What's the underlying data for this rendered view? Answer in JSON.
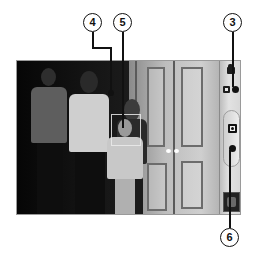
{
  "app": {
    "name": "Camera",
    "mode": "still-photo"
  },
  "viewfinder": {
    "scene": "group of four people standing in front of a white paneled door",
    "focus_indicator": "focus-box"
  },
  "controls": {
    "camcorder_switch": {
      "icon": "camcorder-icon"
    },
    "camera_switch": {
      "icon": "camera-icon"
    },
    "shutter_button": {
      "icon": "camera-icon"
    },
    "last_photo_thumbnail": {
      "icon": "thumbnail-image"
    }
  },
  "callouts": [
    {
      "label": "4",
      "target": "focus-point"
    },
    {
      "label": "5",
      "target": "focus-box"
    },
    {
      "label": "3",
      "target": "camera-mode-switch"
    },
    {
      "label": "6",
      "target": "shutter-button"
    }
  ],
  "colors": {
    "frame_border": "#9a9a9a",
    "control_strip": "#d6d6d6",
    "callout_line": "#111111",
    "background": "#ffffff"
  }
}
